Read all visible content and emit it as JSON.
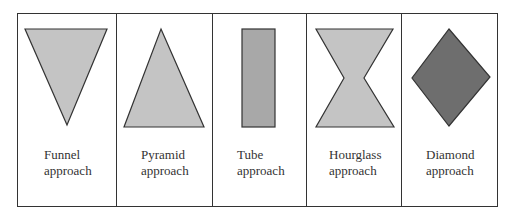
{
  "panels": [
    {
      "name": "funnel",
      "line1": "Funnel",
      "line2": "approach",
      "fill": "#c4c4c4"
    },
    {
      "name": "pyramid",
      "line1": "Pyramid",
      "line2": "approach",
      "fill": "#c4c4c4"
    },
    {
      "name": "tube",
      "line1": "Tube",
      "line2": "approach",
      "fill": "#a8a8a8"
    },
    {
      "name": "hourglass",
      "line1": "Hourglass",
      "line2": "approach",
      "fill": "#c4c4c4"
    },
    {
      "name": "diamond",
      "line1": "Diamond",
      "line2": "approach",
      "fill": "#6e6e6e"
    }
  ]
}
